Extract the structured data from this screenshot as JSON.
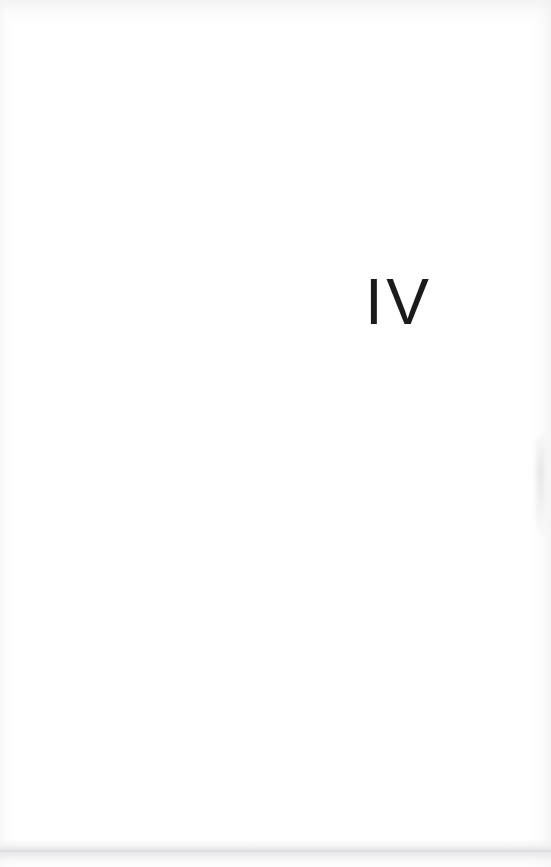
{
  "page": {
    "kind": "book-part-divider-page",
    "width": 551,
    "height": 867,
    "background_color": "#ffffff",
    "text_color": "#1b1b1b"
  },
  "content": {
    "part_numeral": "IV",
    "numeral_system": "roman",
    "numeral_value": "4",
    "alignment": "right-of-center",
    "body_text": "",
    "part_title": ""
  },
  "artifacts": {
    "top_edge_texture": "",
    "left_edge_texture": "",
    "right_edge_texture": "",
    "right_edge_smudge": "",
    "bottom_scan_band": "",
    "bottom_scan_line": "",
    "band_color": "#e4e4e6",
    "texture_color": "#f0f0f2"
  }
}
